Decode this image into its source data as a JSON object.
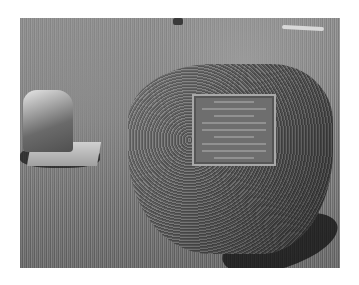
{
  "image": {
    "description": "Black-and-white photograph of a cemetery: a large boulder with a bronze memorial plaque mounted on its face, a small weathered headstone to the left, set in a grassy lawn",
    "subjects": [
      "boulder-with-plaque",
      "small-headstone",
      "grass-lawn",
      "distant-grave-marker",
      "distant-flat-stone"
    ],
    "plaque_text": "",
    "colors": {
      "grass": "#858585",
      "boulder": "#666666",
      "plaque": "#6e6e6e",
      "background": "#ffffff"
    }
  }
}
